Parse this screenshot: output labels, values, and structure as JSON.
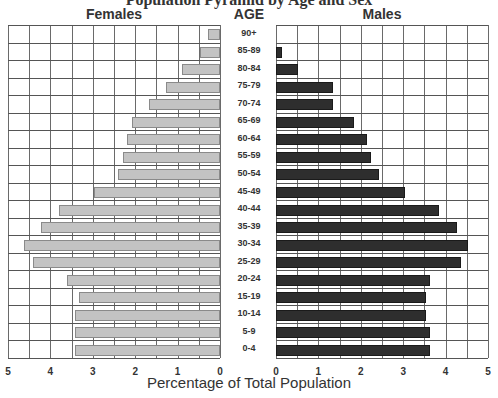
{
  "chart_data": {
    "type": "bar",
    "subtype": "population-pyramid",
    "title": "",
    "left_title": "Females",
    "right_title": "Males",
    "center_title": "AGE",
    "xlabel": "Percentage of Total Population",
    "ylabel": "AGE",
    "xlim": [
      0,
      5
    ],
    "x_ticks": [
      0,
      1,
      2,
      3,
      4,
      5
    ],
    "grid": true,
    "categories": [
      "90+",
      "85-89",
      "80-84",
      "75-79",
      "70-74",
      "65-69",
      "60-64",
      "55-59",
      "50-54",
      "45-49",
      "40-44",
      "35-39",
      "30-34",
      "25-29",
      "20-24",
      "15-19",
      "10-14",
      "5-9",
      "0-4"
    ],
    "series": [
      {
        "name": "Females",
        "color": "#c3c3c3",
        "values": [
          0.28,
          0.47,
          0.9,
          1.27,
          1.67,
          2.08,
          2.19,
          2.29,
          2.4,
          2.97,
          3.8,
          4.22,
          4.62,
          4.41,
          3.61,
          3.32,
          3.42,
          3.42,
          3.43
        ]
      },
      {
        "name": "Males",
        "color": "#2e2e2e",
        "values": [
          0.0,
          0.15,
          0.52,
          1.35,
          1.35,
          1.84,
          2.15,
          2.24,
          2.43,
          3.04,
          3.84,
          4.26,
          4.53,
          4.36,
          3.63,
          3.53,
          3.53,
          3.63,
          3.63
        ]
      }
    ]
  },
  "labels": {
    "females": "Females",
    "males": "Males",
    "age": "AGE",
    "xlabel": "Percentage of Total Population",
    "title_cut": "Population Pyramid by Age and Sex"
  }
}
